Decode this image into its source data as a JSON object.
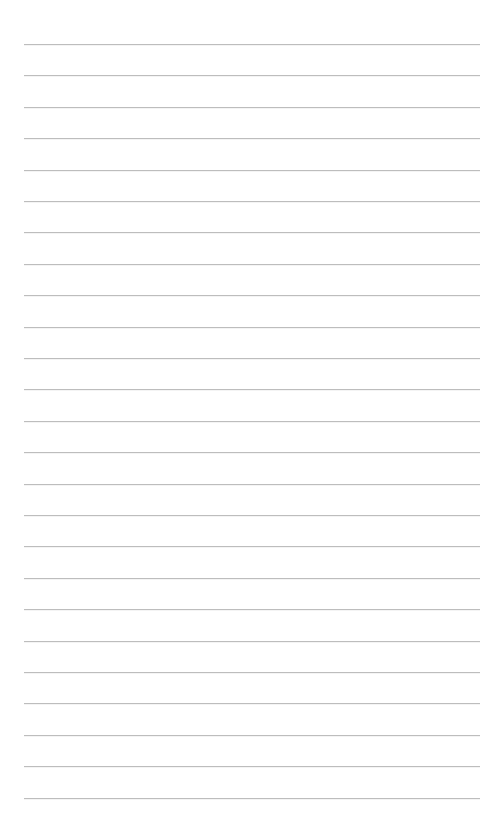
{
  "page": {
    "type": "lined-paper",
    "background_color": "#ffffff",
    "line_color": "#bdbdbd",
    "line_count": 25,
    "first_line_y": 44,
    "line_spacing": 31.4,
    "line_left": 24,
    "line_right": 480
  }
}
